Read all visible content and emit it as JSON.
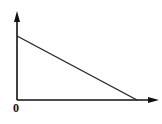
{
  "diagram": {
    "type": "axes-with-line",
    "origin_label": "0",
    "axes": {
      "x_axis": {
        "from": [
          17,
          100
        ],
        "to": [
          158,
          100
        ],
        "arrow": true
      },
      "y_axis": {
        "from": [
          17,
          100
        ],
        "to": [
          17,
          12
        ],
        "arrow": true
      }
    },
    "line": {
      "from": [
        17,
        36
      ],
      "to": [
        137,
        100
      ],
      "description": "decreasing straight line from y-intercept to x-intercept"
    },
    "stroke_color": "#111111"
  }
}
